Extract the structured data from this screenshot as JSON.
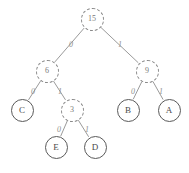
{
  "figure": {
    "type": "huffman-binary-tree",
    "background_color": "#ffffff",
    "internal_node_color": "#7a7a7a",
    "leaf_node_color": "#4a4a4a",
    "edge_color": "#9a9a9a",
    "label_color": "#8f8f8f",
    "caption_text": ""
  },
  "nodes": [
    {
      "id": "n15",
      "label": "15",
      "kind": "internal",
      "cx": 92,
      "cy": 19,
      "r": 11.5
    },
    {
      "id": "n6",
      "label": "6",
      "kind": "internal",
      "cx": 47,
      "cy": 71,
      "r": 11.5
    },
    {
      "id": "n9",
      "label": "9",
      "kind": "internal",
      "cx": 147,
      "cy": 71,
      "r": 11.5
    },
    {
      "id": "n3",
      "label": "3",
      "kind": "internal",
      "cx": 72,
      "cy": 110,
      "r": 11.5
    },
    {
      "id": "lC",
      "label": "C",
      "kind": "leaf",
      "cx": 22,
      "cy": 110,
      "r": 11.5
    },
    {
      "id": "lB",
      "label": "B",
      "kind": "leaf",
      "cx": 128,
      "cy": 110,
      "r": 11.5
    },
    {
      "id": "lA",
      "label": "A",
      "kind": "leaf",
      "cx": 169,
      "cy": 110,
      "r": 11.5
    },
    {
      "id": "lE",
      "label": "E",
      "kind": "leaf",
      "cx": 56,
      "cy": 147,
      "r": 11.5
    },
    {
      "id": "lD",
      "label": "D",
      "kind": "leaf",
      "cx": 95,
      "cy": 147,
      "r": 11.5
    }
  ],
  "edges": [
    {
      "id": "e-15-6",
      "from": "n15",
      "to": "n6",
      "bit": "0",
      "lx": 69,
      "ly": 41
    },
    {
      "id": "e-15-9",
      "from": "n15",
      "to": "n9",
      "bit": "1",
      "lx": 118,
      "ly": 41
    },
    {
      "id": "e-6-C",
      "from": "n6",
      "to": "lC",
      "bit": "0",
      "lx": 31,
      "ly": 88
    },
    {
      "id": "e-6-3",
      "from": "n6",
      "to": "n3",
      "bit": "1",
      "lx": 58,
      "ly": 88
    },
    {
      "id": "e-9-B",
      "from": "n9",
      "to": "lB",
      "bit": "0",
      "lx": 131,
      "ly": 88
    },
    {
      "id": "e-9-A",
      "from": "n9",
      "to": "lA",
      "bit": "1",
      "lx": 159,
      "ly": 88
    },
    {
      "id": "e-3-E",
      "from": "n3",
      "to": "lE",
      "bit": "0",
      "lx": 57,
      "ly": 126
    },
    {
      "id": "e-3-D",
      "from": "n3",
      "to": "lD",
      "bit": "1",
      "lx": 85,
      "ly": 126
    }
  ],
  "codes": [
    {
      "symbol": "C",
      "code": "00"
    },
    {
      "symbol": "E",
      "code": "010"
    },
    {
      "symbol": "D",
      "code": "011"
    },
    {
      "symbol": "B",
      "code": "10"
    },
    {
      "symbol": "A",
      "code": "11"
    }
  ]
}
